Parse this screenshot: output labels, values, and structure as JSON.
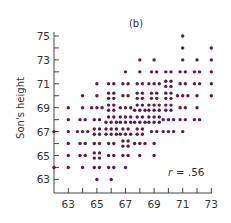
{
  "chart_data": {
    "type": "scatter",
    "title": "(b)",
    "xlabel": "",
    "ylabel": "Son's height",
    "annotation": "r = .56",
    "xlim": [
      62,
      73
    ],
    "ylim": [
      62.5,
      75
    ],
    "x_ticks": [
      63,
      65,
      67,
      69,
      71,
      73
    ],
    "y_ticks": [
      63,
      65,
      67,
      69,
      71,
      73,
      75
    ],
    "grid": false,
    "legend": null,
    "marker_color": "#5a1a4a",
    "points": [
      {
        "x": 71,
        "y": 75,
        "n": 1
      },
      {
        "x": 71,
        "y": 74,
        "n": 1
      },
      {
        "x": 73,
        "y": 74,
        "n": 1
      },
      {
        "x": 68,
        "y": 73,
        "n": 1
      },
      {
        "x": 69,
        "y": 73,
        "n": 1
      },
      {
        "x": 71,
        "y": 73,
        "n": 1
      },
      {
        "x": 72,
        "y": 73,
        "n": 1
      },
      {
        "x": 73,
        "y": 73,
        "n": 1
      },
      {
        "x": 67,
        "y": 72,
        "n": 1
      },
      {
        "x": 68,
        "y": 72,
        "n": 1
      },
      {
        "x": 69,
        "y": 72,
        "n": 2
      },
      {
        "x": 70,
        "y": 72,
        "n": 2
      },
      {
        "x": 71,
        "y": 72,
        "n": 2
      },
      {
        "x": 72,
        "y": 72,
        "n": 2
      },
      {
        "x": 73,
        "y": 72,
        "n": 1
      },
      {
        "x": 65,
        "y": 71,
        "n": 1
      },
      {
        "x": 66,
        "y": 71,
        "n": 2
      },
      {
        "x": 67,
        "y": 71,
        "n": 2
      },
      {
        "x": 68,
        "y": 71,
        "n": 2
      },
      {
        "x": 69,
        "y": 71,
        "n": 3
      },
      {
        "x": 70,
        "y": 71,
        "n": 4
      },
      {
        "x": 71,
        "y": 71,
        "n": 2
      },
      {
        "x": 72,
        "y": 71,
        "n": 2
      },
      {
        "x": 73,
        "y": 71,
        "n": 1
      },
      {
        "x": 64,
        "y": 70,
        "n": 1
      },
      {
        "x": 65,
        "y": 70,
        "n": 1
      },
      {
        "x": 66,
        "y": 70,
        "n": 4
      },
      {
        "x": 67,
        "y": 70,
        "n": 2
      },
      {
        "x": 68,
        "y": 70,
        "n": 4
      },
      {
        "x": 69,
        "y": 70,
        "n": 4
      },
      {
        "x": 70,
        "y": 70,
        "n": 4
      },
      {
        "x": 71,
        "y": 70,
        "n": 3
      },
      {
        "x": 72,
        "y": 70,
        "n": 1
      },
      {
        "x": 73,
        "y": 70,
        "n": 1
      },
      {
        "x": 63,
        "y": 69,
        "n": 1
      },
      {
        "x": 64,
        "y": 69,
        "n": 1
      },
      {
        "x": 65,
        "y": 69,
        "n": 3
      },
      {
        "x": 66,
        "y": 69,
        "n": 4
      },
      {
        "x": 67,
        "y": 69,
        "n": 3
      },
      {
        "x": 68,
        "y": 69,
        "n": 5
      },
      {
        "x": 69,
        "y": 69,
        "n": 6
      },
      {
        "x": 70,
        "y": 69,
        "n": 4
      },
      {
        "x": 71,
        "y": 69,
        "n": 2
      },
      {
        "x": 72,
        "y": 69,
        "n": 1
      },
      {
        "x": 63,
        "y": 68,
        "n": 1
      },
      {
        "x": 64,
        "y": 68,
        "n": 2
      },
      {
        "x": 65,
        "y": 68,
        "n": 2
      },
      {
        "x": 66,
        "y": 68,
        "n": 5
      },
      {
        "x": 67,
        "y": 68,
        "n": 6
      },
      {
        "x": 68,
        "y": 68,
        "n": 5
      },
      {
        "x": 69,
        "y": 68,
        "n": 6
      },
      {
        "x": 70,
        "y": 68,
        "n": 3
      },
      {
        "x": 71,
        "y": 68,
        "n": 2
      },
      {
        "x": 72,
        "y": 68,
        "n": 2
      },
      {
        "x": 62,
        "y": 67,
        "n": 1
      },
      {
        "x": 63,
        "y": 67,
        "n": 1
      },
      {
        "x": 64,
        "y": 67,
        "n": 3
      },
      {
        "x": 65,
        "y": 67,
        "n": 4
      },
      {
        "x": 66,
        "y": 67,
        "n": 6
      },
      {
        "x": 67,
        "y": 67,
        "n": 5
      },
      {
        "x": 68,
        "y": 67,
        "n": 4
      },
      {
        "x": 69,
        "y": 67,
        "n": 2
      },
      {
        "x": 70,
        "y": 67,
        "n": 3
      },
      {
        "x": 71,
        "y": 67,
        "n": 1
      },
      {
        "x": 63,
        "y": 66,
        "n": 1
      },
      {
        "x": 64,
        "y": 66,
        "n": 2
      },
      {
        "x": 65,
        "y": 66,
        "n": 2
      },
      {
        "x": 66,
        "y": 66,
        "n": 2
      },
      {
        "x": 67,
        "y": 66,
        "n": 4
      },
      {
        "x": 68,
        "y": 66,
        "n": 3
      },
      {
        "x": 69,
        "y": 66,
        "n": 1
      },
      {
        "x": 63,
        "y": 65,
        "n": 1
      },
      {
        "x": 64,
        "y": 65,
        "n": 2
      },
      {
        "x": 65,
        "y": 65,
        "n": 4
      },
      {
        "x": 66,
        "y": 65,
        "n": 2
      },
      {
        "x": 67,
        "y": 65,
        "n": 2
      },
      {
        "x": 68,
        "y": 65,
        "n": 1
      },
      {
        "x": 69,
        "y": 65,
        "n": 1
      },
      {
        "x": 62,
        "y": 64,
        "n": 1
      },
      {
        "x": 63,
        "y": 64,
        "n": 1
      },
      {
        "x": 64,
        "y": 64,
        "n": 1
      },
      {
        "x": 65,
        "y": 64,
        "n": 2
      },
      {
        "x": 66,
        "y": 64,
        "n": 2
      },
      {
        "x": 67,
        "y": 64,
        "n": 1
      },
      {
        "x": 65,
        "y": 63,
        "n": 1
      },
      {
        "x": 66,
        "y": 63,
        "n": 1
      }
    ]
  }
}
